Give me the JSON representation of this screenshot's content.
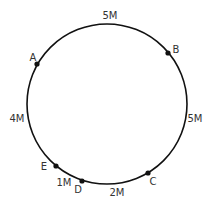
{
  "diagram": {
    "type": "circular-track",
    "circle": {
      "cx": 107,
      "cy": 104,
      "r": 80,
      "stroke": "#111111"
    },
    "points": [
      {
        "id": "A",
        "label": "A",
        "x": 37,
        "y": 64,
        "lx": 33,
        "ly": 61
      },
      {
        "id": "B",
        "label": "B",
        "x": 168,
        "y": 53,
        "lx": 176,
        "ly": 53
      },
      {
        "id": "C",
        "label": "C",
        "x": 148,
        "y": 173,
        "lx": 153,
        "ly": 185
      },
      {
        "id": "D",
        "label": "D",
        "x": 82,
        "y": 181,
        "lx": 78,
        "ly": 193
      },
      {
        "id": "E",
        "label": "E",
        "x": 56,
        "y": 166,
        "lx": 44,
        "ly": 170
      }
    ],
    "segments": [
      {
        "between": "A-B",
        "label": "5M",
        "x": 110,
        "y": 19
      },
      {
        "between": "B-C",
        "label": "5M",
        "x": 195,
        "y": 122
      },
      {
        "between": "C-D",
        "label": "2M",
        "x": 117,
        "y": 196
      },
      {
        "between": "D-E",
        "label": "1M",
        "x": 64,
        "y": 186
      },
      {
        "between": "E-A",
        "label": "4M",
        "x": 17,
        "y": 122
      }
    ]
  }
}
